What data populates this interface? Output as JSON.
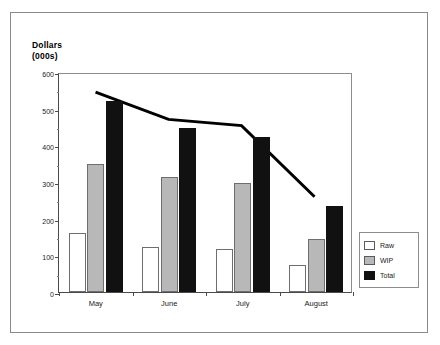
{
  "chart_data": {
    "type": "bar",
    "title": "Dollars (000s)",
    "title_lines": [
      "Dollars",
      "(000s)"
    ],
    "xlabel": "",
    "ylabel": "Dollars (000s)",
    "categories": [
      "May",
      "June",
      "July",
      "August"
    ],
    "ylim": [
      0,
      600
    ],
    "yticks": [
      0,
      100,
      200,
      300,
      400,
      500,
      600
    ],
    "ytick_labels": [
      "0",
      "100",
      "200",
      "300",
      "400",
      "500",
      "600"
    ],
    "yticks_minor": [
      50,
      150,
      250,
      350,
      450,
      550
    ],
    "grid": false,
    "legend_position": "right",
    "series": [
      {
        "name": "Raw",
        "kind": "bar",
        "color": "#ffffff",
        "values": [
          160,
          122,
          117,
          73
        ]
      },
      {
        "name": "WIP",
        "kind": "bar",
        "color": "#b8b8b8",
        "values": [
          348,
          314,
          297,
          145
        ]
      },
      {
        "name": "Total",
        "kind": "bar",
        "color": "#111111",
        "values": [
          522,
          448,
          422,
          234
        ]
      },
      {
        "name": "Trend",
        "kind": "line",
        "color": "#000000",
        "values": [
          550,
          475,
          458,
          262
        ]
      }
    ]
  },
  "legend": {
    "items": [
      {
        "label": "Raw",
        "swatch": "raw"
      },
      {
        "label": "WIP",
        "swatch": "wip"
      },
      {
        "label": "Total",
        "swatch": "total"
      }
    ]
  },
  "colors": {
    "raw": "#ffffff",
    "wip": "#b8b8b8",
    "total": "#111111",
    "line": "#000000",
    "axis": "#4a4a4a",
    "frame": "#8a8a8a"
  }
}
